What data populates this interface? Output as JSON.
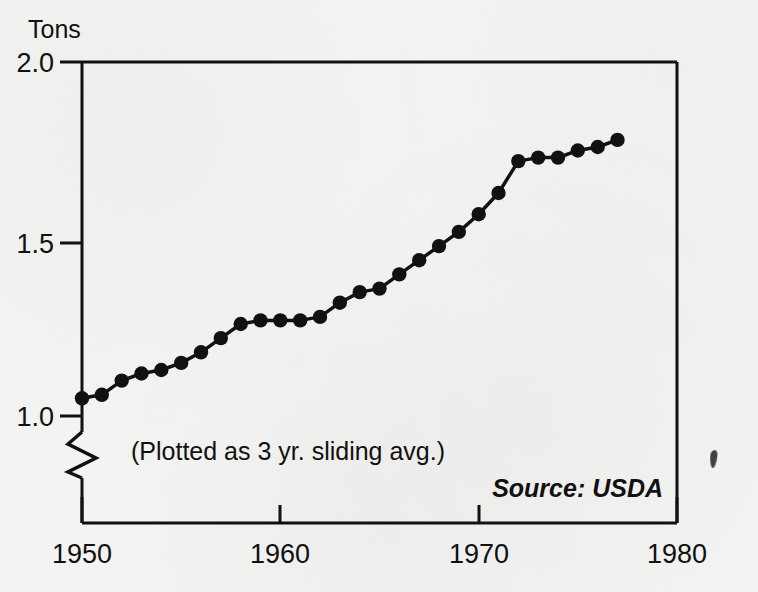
{
  "figure": {
    "background_color": "#f3f3f1",
    "ink_color": "#111111",
    "y_axis_title": "Tons",
    "annotation": "(Plotted as 3 yr. sliding avg.)",
    "source": "Source: USDA",
    "artifact": "ink-smudge"
  },
  "chart_data": {
    "type": "line",
    "title": "",
    "subtitle": "",
    "xlabel": "",
    "ylabel": "Tons",
    "xlim": [
      1950,
      1980
    ],
    "ylim": [
      0.95,
      2.0
    ],
    "grid": false,
    "legend": null,
    "axis_break": {
      "axis": "y",
      "symbol": "zigzag",
      "below_value": 1.0
    },
    "xticks": [
      1950,
      1960,
      1970,
      1980
    ],
    "xtick_labels": [
      "1950",
      "1960",
      "1970",
      "1980"
    ],
    "yticks": [
      1.0,
      1.5,
      2.0
    ],
    "ytick_labels": [
      "1.0",
      "1.5",
      "2.0"
    ],
    "marker": "filled-circle",
    "annotations": [
      {
        "text": "(Plotted as 3 yr. sliding avg.)",
        "x": 1952.0,
        "y": 0.905
      },
      {
        "text": "Source: USDA",
        "x": 1972.0,
        "y": 0.835
      }
    ],
    "series": [
      {
        "name": "Per capita consumption (3 yr. sliding avg.)",
        "x": [
          1950,
          1951,
          1952,
          1953,
          1954,
          1955,
          1956,
          1957,
          1958,
          1959,
          1960,
          1961,
          1962,
          1963,
          1964,
          1965,
          1966,
          1967,
          1968,
          1969,
          1970,
          1971,
          1972,
          1973,
          1974,
          1975,
          1976,
          1977
        ],
        "values": [
          1.05,
          1.06,
          1.1,
          1.12,
          1.13,
          1.15,
          1.18,
          1.22,
          1.26,
          1.27,
          1.27,
          1.27,
          1.28,
          1.32,
          1.35,
          1.36,
          1.4,
          1.44,
          1.48,
          1.52,
          1.57,
          1.63,
          1.72,
          1.73,
          1.73,
          1.75,
          1.76,
          1.78
        ]
      }
    ]
  }
}
